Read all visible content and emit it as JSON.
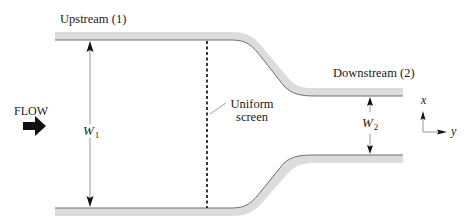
{
  "diagram": {
    "labels": {
      "upstream": "Upstream (1)",
      "downstream": "Downstream (2)",
      "flow": "FLOW",
      "screen_line1": "Uniform",
      "screen_line2": "screen",
      "w1_symbol": "W",
      "w1_subscript": "1",
      "w2_symbol": "W",
      "w2_subscript": "2",
      "axis_x": "x",
      "axis_y": "y"
    },
    "elements": [
      {
        "id": "upper-wall",
        "type": "channel-wall",
        "description": "Upper wall, straight upstream section then smooth contraction down to narrower downstream section"
      },
      {
        "id": "lower-wall",
        "type": "channel-wall",
        "description": "Lower wall, straight upstream section then smooth contraction up to narrower downstream section"
      },
      {
        "id": "uniform-screen",
        "type": "dashed-line",
        "description": "Vertical dashed line spanning upstream channel width",
        "label": "Uniform screen"
      },
      {
        "id": "w1-dimension",
        "type": "double-arrow",
        "description": "Upstream channel width",
        "label": "W1"
      },
      {
        "id": "w2-dimension",
        "type": "double-arrow",
        "description": "Downstream channel width",
        "label": "W2"
      },
      {
        "id": "flow-arrow",
        "type": "block-arrow",
        "description": "Flow direction, left to right",
        "label": "FLOW"
      },
      {
        "id": "axes",
        "type": "coordinate-axes",
        "description": "x axis pointing up, y axis pointing right"
      }
    ],
    "colors": {
      "wall_fill": "#dcdcdc",
      "wall_edge": "#6e6e6e",
      "line": "#7a7a7a",
      "text": "#1a1a1a",
      "arrow": "#111111"
    }
  }
}
